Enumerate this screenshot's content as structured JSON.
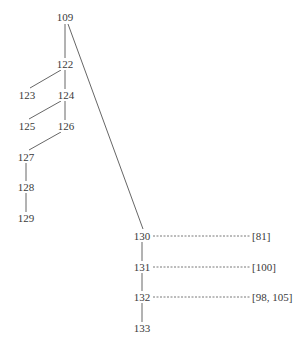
{
  "diagram": {
    "type": "tree",
    "colors": {
      "line": "#555555",
      "text": "#3a3a3a",
      "background": "#ffffff"
    },
    "nodes": [
      {
        "id": "109",
        "label": "109",
        "x": 65,
        "y": 17
      },
      {
        "id": "122",
        "label": "122",
        "x": 65,
        "y": 64
      },
      {
        "id": "123",
        "label": "123",
        "x": 27,
        "y": 95
      },
      {
        "id": "124",
        "label": "124",
        "x": 66,
        "y": 95
      },
      {
        "id": "125",
        "label": "125",
        "x": 27,
        "y": 126
      },
      {
        "id": "126",
        "label": "126",
        "x": 66,
        "y": 126
      },
      {
        "id": "127",
        "label": "127",
        "x": 26,
        "y": 157
      },
      {
        "id": "128",
        "label": "128",
        "x": 26,
        "y": 187
      },
      {
        "id": "129",
        "label": "129",
        "x": 26,
        "y": 218
      },
      {
        "id": "130",
        "label": "130",
        "x": 142,
        "y": 236
      },
      {
        "id": "131",
        "label": "131",
        "x": 142,
        "y": 267
      },
      {
        "id": "132",
        "label": "132",
        "x": 142,
        "y": 297
      },
      {
        "id": "133",
        "label": "133",
        "x": 142,
        "y": 328
      }
    ],
    "edges": [
      {
        "from": "109",
        "to": "122",
        "x1": 65,
        "y1": 24,
        "x2": 65,
        "y2": 58
      },
      {
        "from": "109",
        "to": "130",
        "x1": 68,
        "y1": 24,
        "x2": 143,
        "y2": 229
      },
      {
        "from": "122",
        "to": "123",
        "x1": 61,
        "y1": 70,
        "x2": 30,
        "y2": 88
      },
      {
        "from": "122",
        "to": "124",
        "x1": 65,
        "y1": 70,
        "x2": 65,
        "y2": 89
      },
      {
        "from": "124",
        "to": "125",
        "x1": 61,
        "y1": 101,
        "x2": 29,
        "y2": 119
      },
      {
        "from": "124",
        "to": "126",
        "x1": 65,
        "y1": 101,
        "x2": 65,
        "y2": 120
      },
      {
        "from": "126",
        "to": "127",
        "x1": 61,
        "y1": 132,
        "x2": 29,
        "y2": 150
      },
      {
        "from": "127",
        "to": "128",
        "x1": 26,
        "y1": 163,
        "x2": 26,
        "y2": 181
      },
      {
        "from": "128",
        "to": "129",
        "x1": 26,
        "y1": 193,
        "x2": 26,
        "y2": 212
      },
      {
        "from": "130",
        "to": "131",
        "x1": 142,
        "y1": 242,
        "x2": 142,
        "y2": 261
      },
      {
        "from": "131",
        "to": "132",
        "x1": 142,
        "y1": 273,
        "x2": 142,
        "y2": 291
      },
      {
        "from": "132",
        "to": "133",
        "x1": 142,
        "y1": 303,
        "x2": 142,
        "y2": 322
      }
    ],
    "references": [
      {
        "node": "130",
        "label": "[81]",
        "x1": 153,
        "x2": 251,
        "y": 236
      },
      {
        "node": "131",
        "label": "[100]",
        "x1": 153,
        "x2": 251,
        "y": 267
      },
      {
        "node": "132",
        "label": "[98, 105]",
        "x1": 153,
        "x2": 251,
        "y": 297
      }
    ]
  }
}
